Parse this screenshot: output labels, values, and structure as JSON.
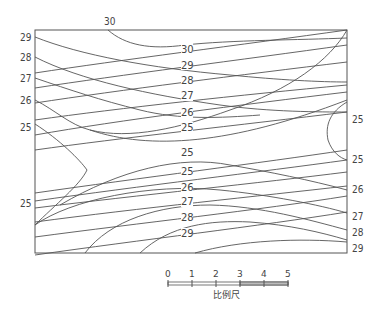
{
  "diagram": {
    "type": "isoline-contour-map",
    "top_label": "30",
    "left_labels": [
      "29",
      "28",
      "27",
      "26",
      "25",
      "25"
    ],
    "right_labels": [
      "25",
      "25",
      "26",
      "27",
      "28",
      "29"
    ],
    "interior_upper_labels": [
      "30",
      "29",
      "28",
      "27",
      "26",
      "25"
    ],
    "interior_center_label": "25",
    "interior_lower_labels": [
      "25",
      "26",
      "27",
      "28",
      "29"
    ],
    "scale_bar": {
      "ticks": [
        "0",
        "1",
        "2",
        "3",
        "4",
        "5"
      ],
      "caption": "比例尺"
    },
    "colors": {
      "line": "#555555",
      "text": "#444444",
      "background": "#ffffff"
    }
  }
}
